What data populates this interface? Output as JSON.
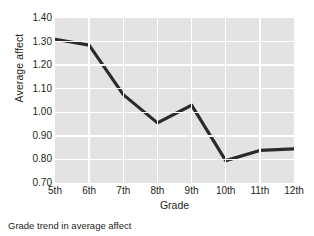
{
  "caption": "Grade trend in average affect",
  "chart_data": {
    "type": "line",
    "title": "",
    "categories": [
      "5th",
      "6th",
      "7th",
      "8th",
      "9th",
      "10th",
      "11th",
      "12th"
    ],
    "values": [
      1.31,
      1.285,
      1.075,
      0.955,
      1.03,
      0.795,
      0.838,
      0.845
    ],
    "xlabel": "Grade",
    "ylabel": "Average affect",
    "ylim": [
      0.7,
      1.4
    ],
    "yticks": [
      0.7,
      0.8,
      0.9,
      1.0,
      1.1,
      1.2,
      1.3,
      1.4
    ],
    "ytick_labels": [
      "0.70",
      "0.80",
      "0.90",
      "1.00",
      "1.10",
      "1.20",
      "1.30",
      "1.40"
    ],
    "grid": true,
    "grid_color": "#ffffff",
    "plot_background": "#e3e3e3",
    "line_color": "#2b2b2b",
    "legend": "none",
    "series": [
      {
        "name": "Average affect",
        "values": [
          1.31,
          1.285,
          1.075,
          0.955,
          1.03,
          0.795,
          0.838,
          0.845
        ]
      }
    ]
  }
}
